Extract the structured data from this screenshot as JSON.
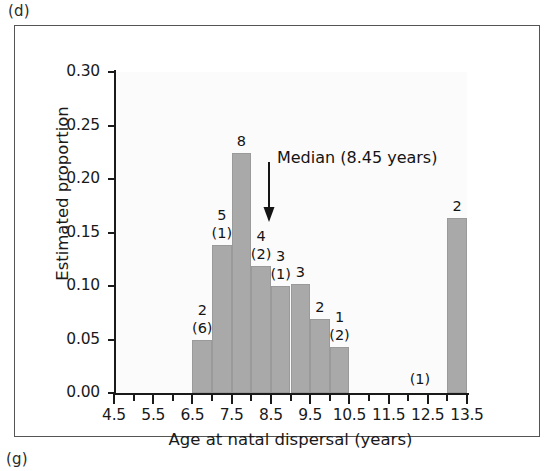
{
  "panel": {
    "tag_top": "(d)",
    "tag_bottom": "(g)"
  },
  "chart_data": {
    "type": "bar",
    "title": "",
    "xlabel": "Age at natal dispersal (years)",
    "ylabel": "Estimated proportion",
    "xlim": [
      4.5,
      13.5
    ],
    "ylim": [
      0.0,
      0.3
    ],
    "grid": false,
    "legend": null,
    "bar_fill_color": "#a9a9a9",
    "x_major_step": 1.0,
    "x_minor_step": 0.5,
    "y_step": 0.05,
    "xticks": [
      "4.5",
      "5.5",
      "6.5",
      "7.5",
      "8.5",
      "9.5",
      "10.5",
      "11.5",
      "12.5",
      "13.5"
    ],
    "xtick_values": [
      4.5,
      5.5,
      6.5,
      7.5,
      8.5,
      9.5,
      10.5,
      11.5,
      12.5,
      13.5
    ],
    "yticks": [
      "0.00",
      "0.05",
      "0.10",
      "0.15",
      "0.20",
      "0.25",
      "0.30"
    ],
    "ytick_values": [
      0.0,
      0.05,
      0.1,
      0.15,
      0.2,
      0.25,
      0.3
    ],
    "bin_width": 0.5,
    "bars": [
      {
        "x_start": 6.5,
        "x_end": 7.0,
        "value": 0.05,
        "count": "2",
        "sub": "(6)"
      },
      {
        "x_start": 7.0,
        "x_end": 7.5,
        "value": 0.138,
        "count": "5",
        "sub": "(1)"
      },
      {
        "x_start": 7.5,
        "x_end": 8.0,
        "value": 0.224,
        "count": "8",
        "sub": ""
      },
      {
        "x_start": 8.0,
        "x_end": 8.5,
        "value": 0.119,
        "count": "4",
        "sub": "(2)"
      },
      {
        "x_start": 8.5,
        "x_end": 9.0,
        "value": 0.1,
        "count": "3",
        "sub": "(1)"
      },
      {
        "x_start": 9.0,
        "x_end": 9.5,
        "value": 0.102,
        "count": "3",
        "sub": ""
      },
      {
        "x_start": 9.5,
        "x_end": 10.0,
        "value": 0.069,
        "count": "2",
        "sub": ""
      },
      {
        "x_start": 10.0,
        "x_end": 10.5,
        "value": 0.043,
        "count": "1",
        "sub": "(2)"
      },
      {
        "x_start": 13.0,
        "x_end": 13.5,
        "value": 0.164,
        "count": "2",
        "sub": ""
      }
    ],
    "zero_height_annotations": [
      {
        "x": 12.3,
        "label": "(1)"
      }
    ],
    "annotations": [
      {
        "kind": "median-marker",
        "text": "Median (8.45 years)",
        "value": 8.45,
        "arrow": "down"
      }
    ]
  }
}
